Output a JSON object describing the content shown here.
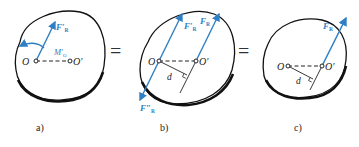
{
  "colors": {
    "force": "#2f7fc4",
    "outline": "#111111",
    "text": "#222222"
  },
  "panels": [
    {
      "caption": "a)",
      "point_O": "O",
      "point_O_prime": "O′",
      "force_label": "F′",
      "force_sub": "R",
      "moment_label": "M′",
      "moment_sub": "O"
    },
    {
      "caption": "b)",
      "point_O": "O",
      "point_O_prime": "O′",
      "force1_label": "F′",
      "force1_sub": "R",
      "force2_label": "F",
      "force2_sub": "R",
      "force3_label": "F″",
      "force3_sub": "R",
      "distance_label": "d"
    },
    {
      "caption": "c)",
      "point_O": "O",
      "point_O_prime": "O′",
      "force_label": "F",
      "force_sub": "R",
      "distance_label": "d"
    }
  ],
  "equals": [
    "=",
    "="
  ]
}
